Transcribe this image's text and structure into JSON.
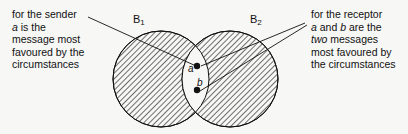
{
  "diagram": {
    "type": "venn",
    "sets": [
      {
        "id": "B1",
        "label_main": "B",
        "label_sub": "1"
      },
      {
        "id": "B2",
        "label_main": "B",
        "label_sub": "2"
      }
    ],
    "points": [
      {
        "id": "a",
        "label": "a",
        "region": "B1 ∩ B2"
      },
      {
        "id": "b",
        "label": "b",
        "region": "B1 ∩ B2"
      }
    ],
    "captions": {
      "left": {
        "line1": "for the sender",
        "line2_italic": "a",
        "line2_rest": " is the",
        "line3": "message most",
        "line4": "favoured by the",
        "line5": "circumstances",
        "points_to": "a"
      },
      "right": {
        "line1": "for the receptor",
        "line2_a": "a",
        "line2_mid": " and ",
        "line2_b": "b",
        "line2_rest": " are the",
        "line3_italic": "two",
        "line3_rest": " messages",
        "line4": "most favoured by",
        "line5": "the circumstances",
        "points_to": [
          "a",
          "b"
        ]
      }
    },
    "colors": {
      "ink": "#111111",
      "background": "#f7f7f5",
      "hatch": "#222222"
    }
  }
}
